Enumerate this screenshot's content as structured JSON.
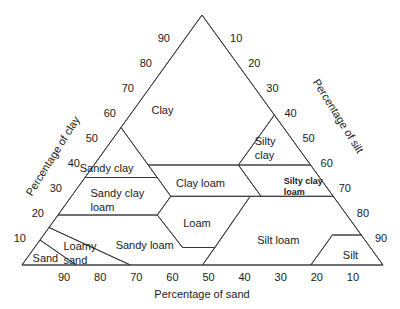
{
  "chart_data": {
    "type": "ternary",
    "title": "",
    "axes": {
      "clay": {
        "label": "Percentage of clay",
        "side": "left",
        "ticks": [
          10,
          20,
          30,
          40,
          50,
          60,
          70,
          80,
          90
        ]
      },
      "silt": {
        "label": "Percentage of silt",
        "side": "right",
        "ticks": [
          10,
          20,
          30,
          40,
          50,
          60,
          70,
          80,
          90
        ]
      },
      "sand": {
        "label": "Percentage of sand",
        "side": "bottom",
        "ticks": [
          90,
          80,
          70,
          60,
          50,
          40,
          30,
          20,
          10
        ]
      }
    },
    "regions": [
      {
        "name": "Clay",
        "label": [
          "Clay"
        ],
        "polygon": [
          [
            45,
            55
          ],
          [
            0,
            100
          ],
          [
            0,
            60
          ],
          [
            20,
            40
          ],
          [
            45,
            40
          ]
        ]
      },
      {
        "name": "Sandy clay",
        "label": [
          "Sandy clay"
        ],
        "polygon": [
          [
            65,
            35
          ],
          [
            45,
            55
          ],
          [
            45,
            35
          ]
        ]
      },
      {
        "name": "Silty clay",
        "label": [
          "Silty",
          "clay"
        ],
        "polygon": [
          [
            20,
            40
          ],
          [
            0,
            60
          ],
          [
            0,
            40
          ]
        ]
      },
      {
        "name": "Clay loam",
        "label": [
          "Clay loam"
        ],
        "polygon": [
          [
            45,
            40
          ],
          [
            20,
            40
          ],
          [
            20,
            27.5
          ],
          [
            45,
            27.5
          ]
        ]
      },
      {
        "name": "Silty clay loam",
        "label": [
          "Silty clay",
          "loam"
        ],
        "bold": true,
        "polygon": [
          [
            20,
            40
          ],
          [
            0,
            40
          ],
          [
            0,
            27.5
          ],
          [
            20,
            27.5
          ]
        ]
      },
      {
        "name": "Sandy clay loam",
        "label": [
          "Sandy clay",
          "loam"
        ],
        "polygon": [
          [
            80,
            20
          ],
          [
            65,
            35
          ],
          [
            45,
            35
          ],
          [
            45,
            27.5
          ],
          [
            52.5,
            20
          ]
        ]
      },
      {
        "name": "Loam",
        "label": [
          "Loam"
        ],
        "polygon": [
          [
            52.5,
            20
          ],
          [
            45,
            27.5
          ],
          [
            23,
            27.5
          ],
          [
            43,
            7
          ],
          [
            52,
            7
          ]
        ]
      },
      {
        "name": "Silt loam",
        "label": [
          "Silt loam"
        ],
        "polygon": [
          [
            50,
            0
          ],
          [
            23,
            27.5
          ],
          [
            0,
            27.5
          ],
          [
            0,
            12
          ],
          [
            8,
            12
          ],
          [
            20,
            0
          ]
        ]
      },
      {
        "name": "Silt",
        "label": [
          "Silt"
        ],
        "polygon": [
          [
            20,
            0
          ],
          [
            8,
            12
          ],
          [
            0,
            12
          ],
          [
            0,
            0
          ]
        ]
      },
      {
        "name": "Sandy loam",
        "label": [
          "Sandy loam"
        ],
        "polygon": [
          [
            70,
            0
          ],
          [
            50,
            0
          ],
          [
            43,
            7
          ],
          [
            52,
            7
          ],
          [
            52.5,
            20
          ],
          [
            80,
            20
          ],
          [
            85,
            15
          ]
        ]
      },
      {
        "name": "Loamy sand",
        "label": [
          "Loamy",
          "sand"
        ],
        "polygon": [
          [
            90,
            10
          ],
          [
            85,
            15
          ],
          [
            70,
            0
          ],
          [
            85,
            0
          ]
        ]
      },
      {
        "name": "Sand",
        "label": [
          "Sand"
        ],
        "polygon": [
          [
            100,
            0
          ],
          [
            90,
            10
          ],
          [
            85,
            0
          ]
        ]
      }
    ],
    "region_label_positions_sand_clay": {
      "Clay": [
        30,
        62
      ],
      "Sandy clay": [
        57,
        39
      ],
      "Silty clay": [
        7,
        47
      ],
      "Clay loam": [
        34,
        33
      ],
      "Silty clay loam": [
        7,
        32
      ],
      "Sandy clay loam": [
        63,
        26
      ],
      "Loam": [
        43,
        17
      ],
      "Silt loam": [
        24,
        10
      ],
      "Silt": [
        7,
        4
      ],
      "Sandy loam": [
        62,
        8
      ],
      "Loamy sand": [
        81,
        5
      ],
      "Sand": [
        92,
        3
      ]
    }
  }
}
